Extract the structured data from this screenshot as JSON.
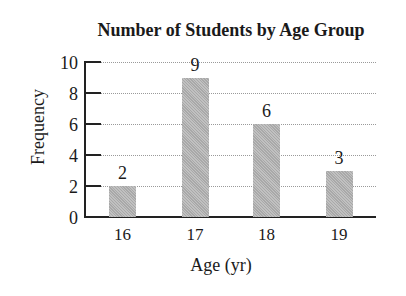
{
  "chart_data": {
    "type": "bar",
    "title": "Number of Students by Age Group",
    "xlabel": "Age (yr)",
    "ylabel": "Frequency",
    "categories": [
      "16",
      "17",
      "18",
      "19"
    ],
    "values": [
      2,
      9,
      6,
      3
    ],
    "data_labels": [
      "2",
      "9",
      "6",
      "3"
    ],
    "ylim": [
      0,
      10
    ],
    "yticks": [
      "0",
      "2",
      "4",
      "6",
      "8",
      "10"
    ],
    "grid": true,
    "grid_style": "dotted horizontal",
    "legend": null,
    "bar_color": "#b3b3b3"
  }
}
